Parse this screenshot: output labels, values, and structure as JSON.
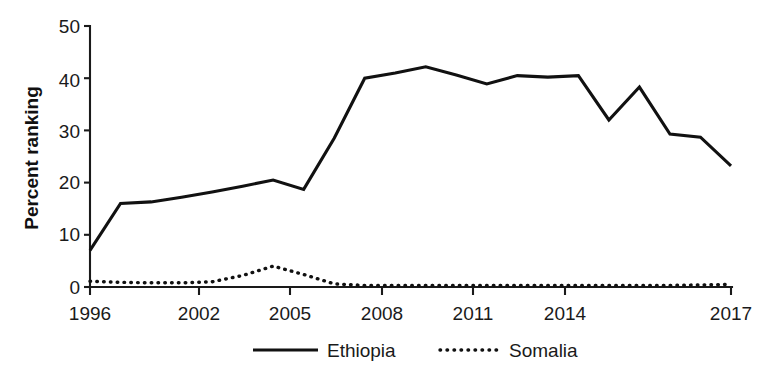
{
  "chart_data": {
    "type": "line",
    "title": "",
    "xlabel": "",
    "ylabel": "Percent ranking",
    "xlim": [
      1996,
      2017
    ],
    "ylim": [
      0,
      50
    ],
    "grid": false,
    "legend_position": "bottom",
    "x": [
      1996,
      1997,
      1998,
      1999,
      2000,
      2001,
      2002,
      2003,
      2004,
      2005,
      2006,
      2007,
      2008,
      2009,
      2010,
      2011,
      2012,
      2013,
      2014,
      2015,
      2016,
      2017
    ],
    "xticks": [
      1996,
      2002,
      2005,
      2008,
      2011,
      2014,
      2017
    ],
    "xticklabels": [
      "1996",
      "2002",
      "2005",
      "2008",
      "2011",
      "2014",
      "2017"
    ],
    "yticks": [
      0,
      10,
      20,
      30,
      40,
      50
    ],
    "yticklabels": [
      "0",
      "10",
      "20",
      "30",
      "40",
      "50"
    ],
    "series": [
      {
        "name": "Ethiopia",
        "style": "solid",
        "color": "#111111",
        "values": [
          7.0,
          16.0,
          16.3,
          17.2,
          18.2,
          19.3,
          20.5,
          18.7,
          28.5,
          40.0,
          41.0,
          42.2,
          40.6,
          38.9,
          40.5,
          40.2,
          40.5,
          32.0,
          38.3,
          29.3,
          28.7,
          23.2
        ]
      },
      {
        "name": "Somalia",
        "style": "dotted",
        "color": "#111111",
        "values": [
          1.1,
          0.9,
          0.8,
          0.8,
          1.0,
          2.2,
          4.0,
          2.4,
          0.6,
          0.3,
          0.3,
          0.3,
          0.3,
          0.3,
          0.3,
          0.3,
          0.3,
          0.3,
          0.3,
          0.3,
          0.4,
          0.5
        ]
      }
    ]
  },
  "legend": {
    "entries": [
      {
        "label": "Ethiopia",
        "style": "solid"
      },
      {
        "label": "Somalia",
        "style": "dotted"
      }
    ]
  },
  "axes": {
    "y_axis_title": "Percent ranking",
    "y_tick_labels": [
      "50",
      "40",
      "30",
      "20",
      "10",
      "0"
    ],
    "x_tick_labels": [
      "1996",
      "2002",
      "2005",
      "2008",
      "2011",
      "2014",
      "2017"
    ]
  },
  "colors": {
    "background": "#ffffff",
    "ink": "#111111",
    "axis": "#1a1a1a"
  }
}
